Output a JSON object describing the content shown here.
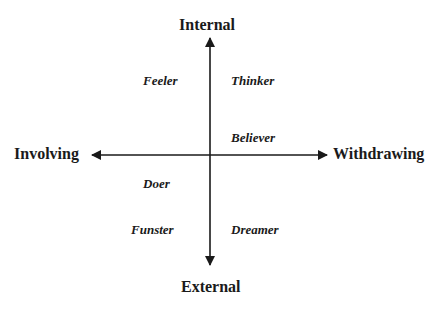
{
  "diagram": {
    "axes": {
      "top": "Internal",
      "bottom": "External",
      "left": "Involving",
      "right": "Withdrawing"
    },
    "quadrant_labels": {
      "upper_left": "Feeler",
      "upper_right": "Thinker",
      "upper_right_near_axis": "Believer",
      "lower_left_near_axis": "Doer",
      "lower_left": "Funster",
      "lower_right": "Dreamer"
    },
    "colors": {
      "line": "#1a1a1a",
      "text": "#1a1a1a",
      "background": "#ffffff"
    }
  }
}
